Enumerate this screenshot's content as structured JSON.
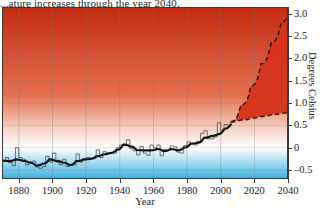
{
  "caption": {
    "top_text": "...ature increases through the year 2040."
  },
  "chart_data": {
    "type": "area",
    "title": "",
    "xlabel": "Year",
    "ylabel": "Degrees Celsius",
    "xlim": [
      1870,
      2040
    ],
    "ylim": [
      -0.7,
      3.15
    ],
    "xticks": [
      1880,
      1900,
      1920,
      1940,
      1960,
      1980,
      2000,
      2020,
      2040
    ],
    "xtick_labels": [
      "1880",
      "1900",
      "1920",
      "1940",
      "1960",
      "1980",
      "2000",
      "2020",
      "2040"
    ],
    "yticks": [
      -0.5,
      0,
      0.5,
      1.0,
      1.5,
      2.0,
      2.5,
      3.0
    ],
    "ytick_labels": [
      "–0.5",
      "0",
      "0.5",
      "1.0",
      "1.5",
      "2.0",
      "2.5",
      "3.0"
    ],
    "grid": true,
    "legend": "none",
    "background_gradient": {
      "above_zero": "#d9331a",
      "at_zero": "#ffffff",
      "below_zero": "#19a6de"
    },
    "series": [
      {
        "name": "Annual mean temperature anomaly",
        "type": "step",
        "color": "#3a3a38",
        "x": [
          1870,
          1872,
          1874,
          1876,
          1878,
          1880,
          1882,
          1884,
          1886,
          1888,
          1890,
          1892,
          1894,
          1896,
          1898,
          1900,
          1902,
          1904,
          1906,
          1908,
          1910,
          1912,
          1914,
          1916,
          1918,
          1920,
          1922,
          1924,
          1926,
          1928,
          1930,
          1932,
          1934,
          1936,
          1938,
          1940,
          1942,
          1944,
          1946,
          1948,
          1950,
          1952,
          1954,
          1956,
          1958,
          1960,
          1962,
          1964,
          1966,
          1968,
          1970,
          1972,
          1974,
          1976,
          1978,
          1980,
          1982,
          1984,
          1986,
          1988,
          1990,
          1992,
          1994,
          1996,
          1998,
          2000,
          2002,
          2004,
          2006
        ],
        "values": [
          -0.3,
          -0.22,
          -0.33,
          -0.4,
          0.0,
          -0.22,
          -0.26,
          -0.38,
          -0.32,
          -0.3,
          -0.43,
          -0.46,
          -0.42,
          -0.19,
          -0.32,
          -0.12,
          -0.28,
          -0.38,
          -0.26,
          -0.42,
          -0.4,
          -0.38,
          -0.14,
          -0.32,
          -0.24,
          -0.22,
          -0.24,
          -0.24,
          -0.05,
          -0.22,
          -0.09,
          -0.12,
          -0.11,
          -0.12,
          0.0,
          0.06,
          0.08,
          0.18,
          -0.02,
          -0.07,
          -0.16,
          0.03,
          -0.12,
          -0.17,
          0.06,
          0.0,
          0.06,
          -0.18,
          -0.04,
          -0.06,
          0.04,
          0.02,
          -0.1,
          -0.12,
          0.05,
          0.13,
          0.09,
          0.06,
          0.14,
          0.32,
          0.38,
          0.2,
          0.2,
          0.24,
          0.56,
          0.36,
          0.52,
          0.5,
          0.58
        ]
      },
      {
        "name": "Smoothed (5-year mean)",
        "type": "line",
        "color": "#151513",
        "x": [
          1870,
          1874,
          1878,
          1882,
          1886,
          1890,
          1894,
          1898,
          1902,
          1906,
          1910,
          1914,
          1918,
          1922,
          1926,
          1930,
          1934,
          1938,
          1942,
          1946,
          1950,
          1954,
          1958,
          1962,
          1966,
          1970,
          1974,
          1978,
          1982,
          1986,
          1990,
          1994,
          1998,
          2002,
          2006
        ],
        "values": [
          -0.29,
          -0.3,
          -0.26,
          -0.29,
          -0.33,
          -0.4,
          -0.36,
          -0.26,
          -0.3,
          -0.33,
          -0.39,
          -0.3,
          -0.27,
          -0.25,
          -0.19,
          -0.15,
          -0.12,
          -0.05,
          0.07,
          0.03,
          -0.05,
          -0.06,
          -0.06,
          -0.03,
          -0.08,
          -0.03,
          -0.06,
          0.0,
          0.09,
          0.11,
          0.22,
          0.26,
          0.3,
          0.42,
          0.52
        ]
      },
      {
        "name": "Projection upper bound",
        "type": "dashed",
        "color": "#151513",
        "x": [
          2006,
          2012,
          2018,
          2024,
          2030,
          2036,
          2040
        ],
        "values": [
          0.58,
          0.95,
          1.38,
          1.88,
          2.35,
          2.8,
          3.0
        ]
      },
      {
        "name": "Projection lower bound",
        "type": "dashed",
        "color": "#151513",
        "x": [
          2006,
          2012,
          2018,
          2024,
          2030,
          2036,
          2040
        ],
        "values": [
          0.58,
          0.62,
          0.66,
          0.7,
          0.74,
          0.77,
          0.79
        ]
      }
    ],
    "projection_wedge": {
      "name": "Projected warming range",
      "fill": "#d6351b",
      "start_year": 2006,
      "end_year": 2040,
      "end_low": 0.79,
      "end_high": 3.0
    }
  }
}
